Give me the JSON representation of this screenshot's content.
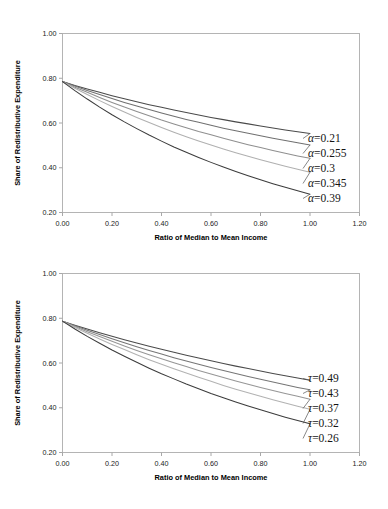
{
  "figure": {
    "background_color": "#ffffff",
    "panel_count": 2
  },
  "chart_data": [
    {
      "type": "line",
      "panel_id": "alpha-panel",
      "title": "",
      "xlabel": "Ratio of Median to Mean Income",
      "ylabel": "Share of Redistributive Expenditure",
      "xlim": [
        0.0,
        1.2
      ],
      "ylim": [
        0.2,
        1.0
      ],
      "xticks": [
        "0.00",
        "0.20",
        "0.40",
        "0.60",
        "0.80",
        "1.00",
        "1.20"
      ],
      "yticks": [
        "0.20",
        "0.40",
        "0.60",
        "0.80",
        "1.00"
      ],
      "xtick_values": [
        0.0,
        0.2,
        0.4,
        0.6,
        0.8,
        1.0,
        1.2
      ],
      "ytick_values": [
        0.2,
        0.4,
        0.6,
        0.8,
        1.0
      ],
      "grid": false,
      "legend_position": "right-inline",
      "x": [
        0.0,
        0.05,
        0.1,
        0.15,
        0.2,
        0.25,
        0.3,
        0.35,
        0.4,
        0.45,
        0.5,
        0.55,
        0.6,
        0.65,
        0.7,
        0.75,
        0.8,
        0.85,
        0.9,
        0.95,
        1.0
      ],
      "series": [
        {
          "name": "α=0.21",
          "label": "0.21",
          "symbol": "α",
          "color": "#4a4a4a",
          "values": [
            0.785,
            0.768,
            0.752,
            0.737,
            0.722,
            0.708,
            0.695,
            0.682,
            0.67,
            0.658,
            0.647,
            0.636,
            0.625,
            0.615,
            0.605,
            0.596,
            0.587,
            0.578,
            0.569,
            0.561,
            0.553
          ]
        },
        {
          "name": "α=0.255",
          "label": "0.255",
          "symbol": "α",
          "color": "#707070",
          "values": [
            0.785,
            0.765,
            0.745,
            0.727,
            0.709,
            0.692,
            0.676,
            0.66,
            0.645,
            0.63,
            0.616,
            0.603,
            0.59,
            0.577,
            0.565,
            0.554,
            0.543,
            0.532,
            0.522,
            0.512,
            0.502
          ]
        },
        {
          "name": "α=0.3",
          "label": "0.3",
          "symbol": "α",
          "color": "#8f8f8f",
          "values": [
            0.785,
            0.76,
            0.737,
            0.714,
            0.692,
            0.671,
            0.651,
            0.632,
            0.613,
            0.596,
            0.579,
            0.562,
            0.547,
            0.532,
            0.517,
            0.503,
            0.49,
            0.477,
            0.465,
            0.453,
            0.442
          ]
        },
        {
          "name": "α=0.345",
          "label": "0.345",
          "symbol": "α",
          "color": "#b0b0b0",
          "values": [
            0.785,
            0.755,
            0.727,
            0.7,
            0.674,
            0.649,
            0.625,
            0.602,
            0.58,
            0.559,
            0.539,
            0.52,
            0.502,
            0.484,
            0.467,
            0.451,
            0.436,
            0.421,
            0.407,
            0.393,
            0.38
          ]
        },
        {
          "name": "α=0.39",
          "label": "0.39",
          "symbol": "α",
          "color": "#3c3c3c",
          "values": [
            0.785,
            0.745,
            0.707,
            0.671,
            0.637,
            0.605,
            0.575,
            0.546,
            0.519,
            0.493,
            0.469,
            0.446,
            0.424,
            0.403,
            0.383,
            0.364,
            0.346,
            0.329,
            0.313,
            0.297,
            0.282
          ]
        }
      ]
    },
    {
      "type": "line",
      "panel_id": "tau-panel",
      "title": "",
      "xlabel": "Ratio of Median to Mean Income",
      "ylabel": "Share of Redistributive Expenditure",
      "xlim": [
        0.0,
        1.2
      ],
      "ylim": [
        0.2,
        1.0
      ],
      "xticks": [
        "0.00",
        "0.20",
        "0.40",
        "0.60",
        "0.80",
        "1.00",
        "1.20"
      ],
      "yticks": [
        "0.20",
        "0.40",
        "0.60",
        "0.80",
        "1.00"
      ],
      "xtick_values": [
        0.0,
        0.2,
        0.4,
        0.6,
        0.8,
        1.0,
        1.2
      ],
      "ytick_values": [
        0.2,
        0.4,
        0.6,
        0.8,
        1.0
      ],
      "grid": false,
      "legend_position": "right-inline",
      "x": [
        0.0,
        0.05,
        0.1,
        0.15,
        0.2,
        0.25,
        0.3,
        0.35,
        0.4,
        0.45,
        0.5,
        0.55,
        0.6,
        0.65,
        0.7,
        0.75,
        0.8,
        0.85,
        0.9,
        0.95,
        1.0
      ],
      "series": [
        {
          "name": "τ=0.49",
          "label": "0.49",
          "symbol": "τ",
          "color": "#4a4a4a",
          "values": [
            0.787,
            0.769,
            0.752,
            0.735,
            0.719,
            0.704,
            0.689,
            0.675,
            0.661,
            0.648,
            0.635,
            0.622,
            0.61,
            0.598,
            0.586,
            0.575,
            0.564,
            0.553,
            0.543,
            0.533,
            0.523
          ]
        },
        {
          "name": "τ=0.43",
          "label": "0.43",
          "symbol": "τ",
          "color": "#767676",
          "values": [
            0.787,
            0.766,
            0.746,
            0.727,
            0.708,
            0.69,
            0.673,
            0.656,
            0.64,
            0.624,
            0.609,
            0.594,
            0.58,
            0.566,
            0.553,
            0.54,
            0.527,
            0.515,
            0.503,
            0.491,
            0.48
          ]
        },
        {
          "name": "τ=0.37",
          "label": "0.37",
          "symbol": "τ",
          "color": "#969696",
          "values": [
            0.787,
            0.763,
            0.74,
            0.718,
            0.697,
            0.676,
            0.656,
            0.637,
            0.619,
            0.601,
            0.584,
            0.567,
            0.551,
            0.535,
            0.52,
            0.505,
            0.491,
            0.477,
            0.464,
            0.451,
            0.438
          ]
        },
        {
          "name": "τ=0.32",
          "label": "0.32",
          "symbol": "τ",
          "color": "#b2b2b2",
          "values": [
            0.787,
            0.759,
            0.733,
            0.707,
            0.683,
            0.66,
            0.637,
            0.615,
            0.594,
            0.574,
            0.555,
            0.536,
            0.518,
            0.5,
            0.483,
            0.467,
            0.451,
            0.436,
            0.421,
            0.407,
            0.393
          ]
        },
        {
          "name": "τ=0.26",
          "label": "0.26",
          "symbol": "τ",
          "color": "#3c3c3c",
          "values": [
            0.787,
            0.752,
            0.719,
            0.688,
            0.658,
            0.63,
            0.603,
            0.577,
            0.552,
            0.529,
            0.506,
            0.485,
            0.464,
            0.445,
            0.426,
            0.408,
            0.391,
            0.374,
            0.358,
            0.343,
            0.328
          ]
        }
      ]
    }
  ],
  "panels": {
    "alpha": {
      "ylabel": "Share of Redistributive Expenditure",
      "xlabel": "Ratio of Median to Mean Income",
      "ytick_labels": [
        "1.00",
        "0.80",
        "0.60",
        "0.40",
        "0.20"
      ],
      "xtick_labels": [
        "0.00",
        "0.20",
        "0.40",
        "0.60",
        "0.80",
        "1.00",
        "1.20"
      ],
      "legend": [
        {
          "text": "α=0.21"
        },
        {
          "text": "α=0.255"
        },
        {
          "text": "α=0.3"
        },
        {
          "text": "α=0.345"
        },
        {
          "text": "α=0.39"
        }
      ]
    },
    "tau": {
      "ylabel": "Share of Redistributive Expenditure",
      "xlabel": "Ratio of Median to Mean Income",
      "ytick_labels": [
        "1.00",
        "0.80",
        "0.60",
        "0.40",
        "0.20"
      ],
      "xtick_labels": [
        "0.00",
        "0.20",
        "0.40",
        "0.60",
        "0.80",
        "1.00",
        "1.20"
      ],
      "legend": [
        {
          "text": "τ=0.49"
        },
        {
          "text": "τ=0.43"
        },
        {
          "text": "τ=0.37"
        },
        {
          "text": "τ=0.32"
        },
        {
          "text": "τ=0.26"
        }
      ]
    }
  }
}
